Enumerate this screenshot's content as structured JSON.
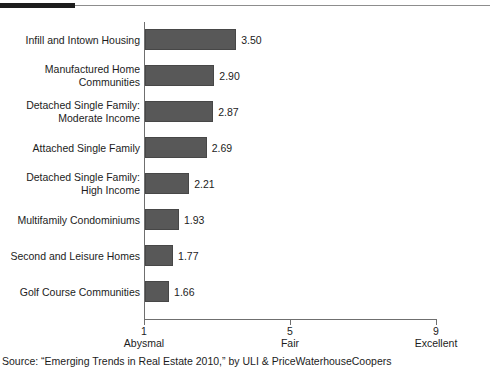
{
  "chart_data": {
    "type": "bar",
    "orientation": "horizontal",
    "title": "",
    "xlabel": "",
    "ylabel": "",
    "xlim": [
      1,
      9
    ],
    "grid": false,
    "legend": null,
    "categories": [
      "Infill and Intown Housing",
      "Manufactured Home\nCommunities",
      "Detached Single Family:\nModerate Income",
      "Attached Single Family",
      "Detached Single Family:\nHigh Income",
      "Multifamily Condominiums",
      "Second and Leisure Homes",
      "Golf Course Communities"
    ],
    "values": [
      3.5,
      2.9,
      2.87,
      2.69,
      2.21,
      1.93,
      1.77,
      1.66
    ],
    "value_labels": [
      "3.50",
      "2.90",
      "2.87",
      "2.69",
      "2.21",
      "1.93",
      "1.77",
      "1.66"
    ],
    "xticks": [
      1,
      5,
      9
    ],
    "xtick_labels": [
      "1",
      "5",
      "9"
    ],
    "xtick_descriptions": [
      "Abysmal",
      "Fair",
      "Excellent"
    ],
    "bar_color": "#585858",
    "axis_color": "#6f6f6f"
  },
  "source": {
    "text": "Source: “Emerging Trends in Real Estate 2010,” by ULI & PriceWaterhouseCoopers"
  },
  "decorations": {
    "rule_color": "#1d1d1d"
  }
}
